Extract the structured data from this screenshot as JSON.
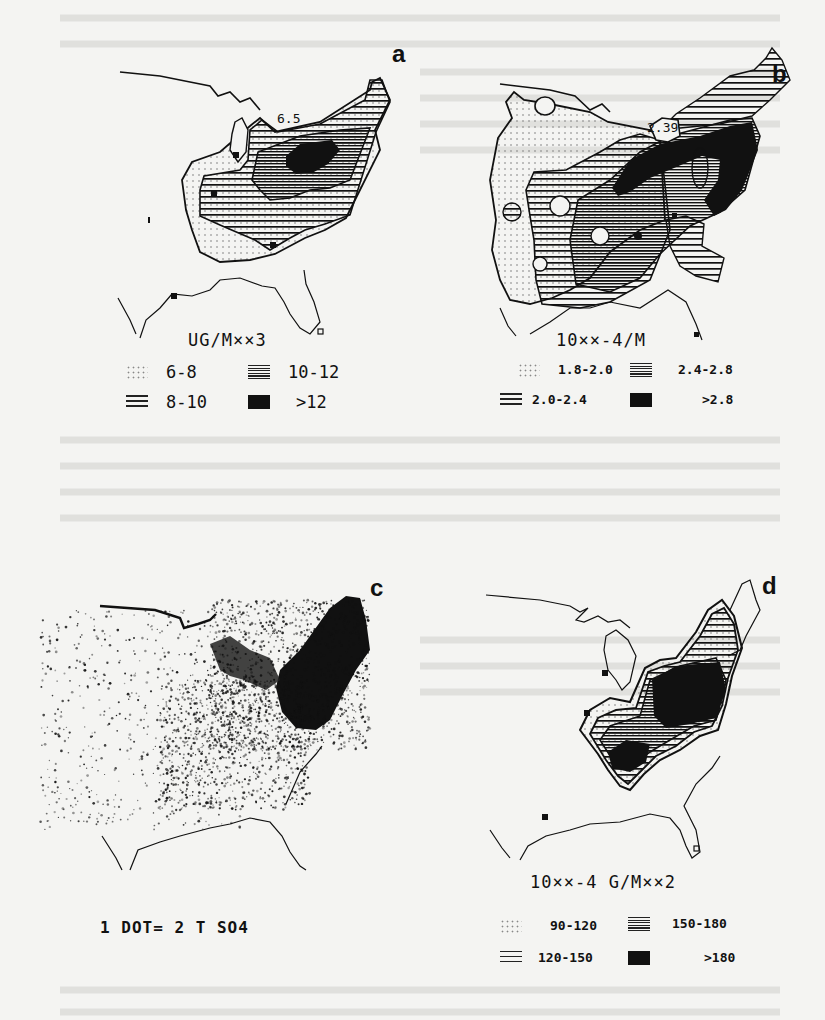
{
  "figure": {
    "type": "multi-panel map figure",
    "region": "Eastern United States"
  },
  "panels": [
    {
      "id": "a",
      "letter": "a",
      "annotation": "6.5",
      "legend": {
        "title": "UG/M**3",
        "title_display": "UG/M××3",
        "items": [
          {
            "pattern": "dots",
            "label": "6-8"
          },
          {
            "pattern": "dense-lines",
            "label": "10-12"
          },
          {
            "pattern": "lines",
            "label": "8-10"
          },
          {
            "pattern": "solid",
            "label": ">12"
          }
        ]
      }
    },
    {
      "id": "b",
      "letter": "b",
      "annotation": "2.39",
      "legend": {
        "title": "10**-4/M",
        "title_display": "10××-4/M",
        "items": [
          {
            "pattern": "dots",
            "label": "1.8-2.0"
          },
          {
            "pattern": "dense-lines",
            "label": "2.4-2.8"
          },
          {
            "pattern": "lines",
            "label": "2.0-2.4"
          },
          {
            "pattern": "solid",
            "label": ">2.8"
          }
        ]
      }
    },
    {
      "id": "c",
      "letter": "c",
      "caption": "1 DOT= 2 T SO4"
    },
    {
      "id": "d",
      "letter": "d",
      "legend": {
        "title": "10**-4 G/M**2",
        "title_display": "10××-4 G/M××2",
        "items": [
          {
            "pattern": "dots",
            "label": "90-120"
          },
          {
            "pattern": "dense-lines",
            "label": "150-180"
          },
          {
            "pattern": "lines",
            "label": "120-150"
          },
          {
            "pattern": "solid",
            "label": ">180"
          }
        ]
      }
    }
  ],
  "colors": {
    "background": "#f4f4f2",
    "ink": "#111111",
    "dots": "#888888"
  }
}
